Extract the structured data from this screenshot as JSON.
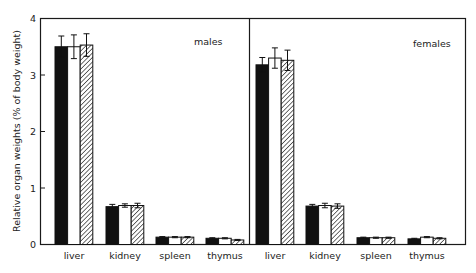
{
  "chart_data": {
    "type": "bar",
    "title": "",
    "xlabel": "",
    "ylabel": "Relative organ weights (% of body weight)",
    "ylim": [
      0,
      4
    ],
    "yticks": [
      0,
      1,
      2,
      3,
      4
    ],
    "grid": false,
    "legend": "none shown",
    "bar_styles": [
      "solid black",
      "white/open",
      "diagonal hatched"
    ],
    "panels": [
      {
        "label": "males",
        "categories": [
          "liver",
          "kidney",
          "spleen",
          "thymus"
        ],
        "series": [
          {
            "name": "group 1 (black)",
            "values": [
              3.5,
              0.67,
              0.13,
              0.11
            ],
            "errors": [
              0.19,
              0.04,
              0.01,
              0.01
            ]
          },
          {
            "name": "group 2 (white)",
            "values": [
              3.5,
              0.69,
              0.13,
              0.11
            ],
            "errors": [
              0.21,
              0.03,
              0.01,
              0.01
            ]
          },
          {
            "name": "group 3 (hatched)",
            "values": [
              3.53,
              0.69,
              0.13,
              0.08
            ],
            "errors": [
              0.2,
              0.04,
              0.01,
              0.01
            ]
          }
        ]
      },
      {
        "label": "females",
        "categories": [
          "liver",
          "kidney",
          "spleen",
          "thymus"
        ],
        "series": [
          {
            "name": "group 1 (black)",
            "values": [
              3.18,
              0.68,
              0.12,
              0.1
            ],
            "errors": [
              0.13,
              0.03,
              0.01,
              0.01
            ]
          },
          {
            "name": "group 2 (white)",
            "values": [
              3.3,
              0.69,
              0.12,
              0.13
            ],
            "errors": [
              0.18,
              0.04,
              0.01,
              0.01
            ]
          },
          {
            "name": "group 3 (hatched)",
            "values": [
              3.26,
              0.68,
              0.12,
              0.11
            ],
            "errors": [
              0.18,
              0.04,
              0.01,
              0.01
            ]
          }
        ]
      }
    ]
  },
  "labels": {
    "ylabel": "Relative organ weights (% of body weight)",
    "panel_males": "males",
    "panel_females": "females",
    "ticks": [
      "0",
      "1",
      "2",
      "3",
      "4"
    ],
    "male_categories": [
      "liver",
      "kidney",
      "spleen",
      "thymus"
    ],
    "female_categories": [
      "liver",
      "kidney",
      "spleen",
      "thymus"
    ]
  },
  "colors": {
    "axis": "#1a1a1a",
    "bar_black": "#111111",
    "bar_white": "#ffffff",
    "hatch": "#222222"
  }
}
